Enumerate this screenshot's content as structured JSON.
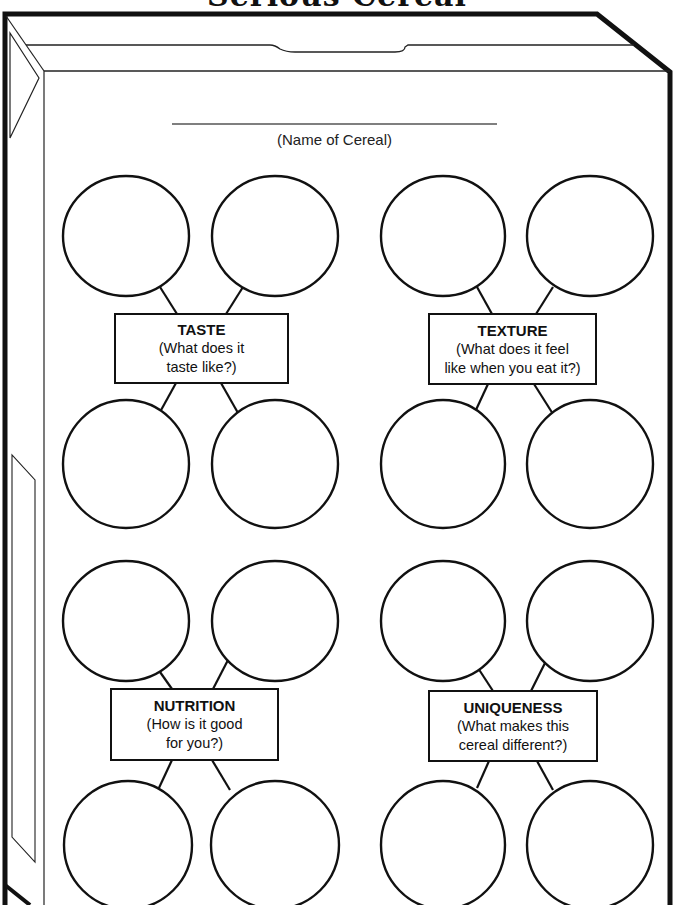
{
  "page": {
    "title": "Serious Cereal",
    "name_field": {
      "label": "(Name of Cereal)",
      "value": ""
    }
  },
  "clusters": [
    {
      "id": "taste",
      "heading": "TASTE",
      "question": "(What does it\ntaste like?)"
    },
    {
      "id": "texture",
      "heading": "TEXTURE",
      "question": "(What does it feel\nlike when you eat it?)"
    },
    {
      "id": "nutrition",
      "heading": "NUTRITION",
      "question": "(How is it good\nfor you?)"
    },
    {
      "id": "uniqueness",
      "heading": "UNIQUENESS",
      "question": "(What makes this\ncereal different?)"
    }
  ],
  "colors": {
    "ink": "#111111",
    "paper": "#ffffff",
    "thin_line": "#555555"
  }
}
